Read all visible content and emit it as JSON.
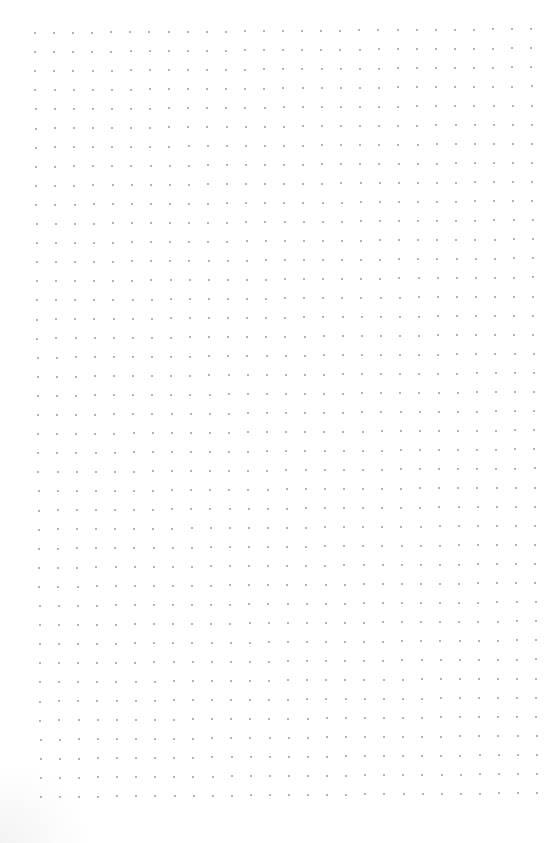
{
  "page": {
    "type": "dot-grid paper",
    "background_color": "#ffffff"
  },
  "grid": {
    "columns": 27,
    "rows": 41,
    "origin_x": 35,
    "origin_y": 33,
    "spacing_x": 19.1,
    "spacing_y": 19.1,
    "dot_color": "#9a9a9a",
    "dot_size": 2
  }
}
